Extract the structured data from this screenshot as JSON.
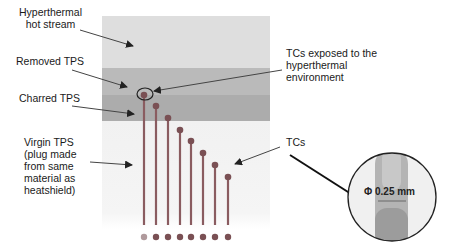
{
  "labels": {
    "hot_stream_line1": "Hyperthermal",
    "hot_stream_line2": "hot stream",
    "removed_tps": "Removed TPS",
    "charred_tps": "Charred TPS",
    "virgin_line1": "Virgin TPS",
    "virgin_line2": "(plug made",
    "virgin_line3": "from same",
    "virgin_line4": "material as",
    "virgin_line5": "heatshield)",
    "exposed_line1": "TCs exposed to the",
    "exposed_line2": "hyperthermal",
    "exposed_line3": "environment",
    "tcs": "TCs",
    "diameter": "Φ 0.25 mm"
  },
  "layers": {
    "hot_stream_color": "#dcdcdc",
    "removed_color": "#b9b9b9",
    "charred_color": "#aaaaaa",
    "virgin_color": "#f2f2f2"
  },
  "thermocouples": {
    "count": 8,
    "line_color": "#8a5a5e",
    "bead_color": "#7a4e52",
    "x_positions": [
      144,
      156,
      168,
      180,
      191,
      203,
      215,
      228
    ],
    "top_y": [
      95,
      106,
      118,
      130,
      141,
      153,
      165,
      177
    ]
  },
  "detail_inset": {
    "shape": "circle",
    "feature": "thermocouple-tip-magnified"
  }
}
